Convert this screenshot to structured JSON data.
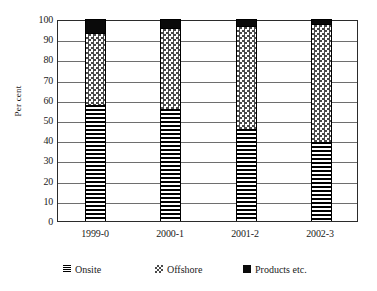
{
  "chart_data": {
    "type": "bar",
    "subtype": "stacked-100",
    "title": "",
    "xlabel": "",
    "ylabel": "Per cent",
    "ylim": [
      0,
      100
    ],
    "ytick_step": 10,
    "ytick_labels": [
      "0",
      "10",
      "20",
      "30",
      "40",
      "50",
      "60",
      "70",
      "80",
      "90",
      "100"
    ],
    "grid": true,
    "legend_position": "bottom",
    "categories": [
      "1999-0",
      "2000-1",
      "2001-2",
      "2002-3"
    ],
    "series": [
      {
        "name": "Onsite",
        "pattern": "horizontal-lines",
        "values": [
          57.5,
          55.5,
          45.5,
          39.0
        ]
      },
      {
        "name": "Offshore",
        "pattern": "checkerboard",
        "values": [
          35.0,
          39.5,
          50.5,
          58.0
        ]
      },
      {
        "name": "Products etc.",
        "pattern": "solid-black",
        "values": [
          7.5,
          5.0,
          4.0,
          3.0
        ]
      }
    ]
  },
  "axes": {
    "y_title": "Per cent"
  },
  "legend": {
    "items": [
      {
        "label": "Onsite"
      },
      {
        "label": "Offshore"
      },
      {
        "label": "Products etc."
      }
    ]
  }
}
